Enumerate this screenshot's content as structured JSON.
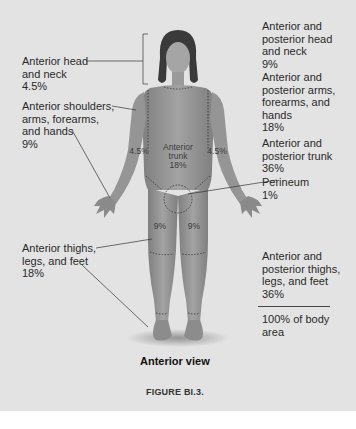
{
  "figure": {
    "view_caption": "Anterior view",
    "figure_number": "FIGURE BI.3.",
    "left_labels": [
      {
        "text": "Anterior head\nand neck\n4.5%"
      },
      {
        "text": "Anterior shoulders,\narms, forearms,\nand hands\n9%"
      },
      {
        "text": "Anterior thighs,\nlegs, and feet\n18%"
      }
    ],
    "right_labels": [
      {
        "text": "Anterior and\nposterior head\nand neck\n9%"
      },
      {
        "text": "Anterior and\nposterior arms,\nforearms, and\nhands\n18%"
      },
      {
        "text": "Anterior and\nposterior trunk\n36%"
      },
      {
        "text": "Perineum\n1%"
      },
      {
        "text": "Anterior and\nposterior thighs,\nlegs, and feet\n36%"
      },
      {
        "text": "100% of body\narea"
      }
    ],
    "body_labels": {
      "left_arm": "4.5%",
      "right_arm": "4.5%",
      "trunk": "Anterior\ntrunk\n18%",
      "left_thigh": "9%",
      "right_thigh": "9%"
    },
    "colors": {
      "background": "#e3e3e3",
      "skin": "#9a9a9a",
      "skin_dark": "#7d7d7d",
      "hair": "#3a3a3a",
      "text": "#2a2a2a"
    }
  }
}
